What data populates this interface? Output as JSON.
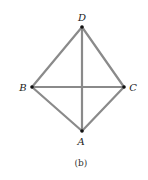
{
  "figure": {
    "caption": "(b)",
    "edge_color": "#8a8a8a",
    "vertex_color": "#111111"
  },
  "vertices": {
    "A": {
      "label": "A",
      "x": 82,
      "y": 131
    },
    "B": {
      "label": "B",
      "x": 32,
      "y": 87
    },
    "C": {
      "label": "C",
      "x": 124,
      "y": 87
    },
    "D": {
      "label": "D",
      "x": 82,
      "y": 27
    }
  },
  "edges": [
    [
      "D",
      "B"
    ],
    [
      "D",
      "C"
    ],
    [
      "D",
      "A"
    ],
    [
      "B",
      "C"
    ],
    [
      "B",
      "A"
    ],
    [
      "C",
      "A"
    ]
  ]
}
